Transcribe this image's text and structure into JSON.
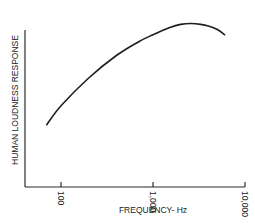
{
  "chart_data": {
    "type": "line",
    "title": "",
    "xlabel": "FREQUENCY- Hz",
    "ylabel": "HUMAN  LOUDNESS  RESPONSE",
    "x_scale": "log",
    "xlim": [
      50,
      10000
    ],
    "ylim": [
      0,
      1
    ],
    "x_ticks": [
      100,
      1000,
      10000
    ],
    "x_tick_labels": [
      "100",
      "1,000",
      "10,000"
    ],
    "y_ticks": [],
    "grid": false,
    "legend": "none",
    "series": [
      {
        "name": "Human loudness response",
        "x": [
          70,
          100,
          200,
          400,
          700,
          1000,
          1500,
          2000,
          2600,
          3300,
          4000,
          5000,
          6000
        ],
        "y": [
          0.36,
          0.47,
          0.63,
          0.76,
          0.84,
          0.88,
          0.92,
          0.94,
          0.945,
          0.94,
          0.93,
          0.91,
          0.88
        ]
      }
    ]
  }
}
